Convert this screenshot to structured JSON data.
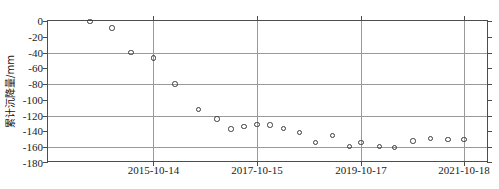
{
  "chart_data": {
    "type": "scatter",
    "title": "",
    "xlabel": "",
    "ylabel": "累计沉降量/mm",
    "x_tick_labels": [
      "2015-10-14",
      "2017-10-15",
      "2019-10-17",
      "2021-10-18"
    ],
    "x_tick_positions": [
      0.2392,
      0.4739,
      0.7098,
      0.9433
    ],
    "y_tick_labels": [
      "0",
      "-20",
      "-40",
      "-60",
      "-80",
      "-100",
      "-120",
      "-140",
      "-160",
      "-180"
    ],
    "y_tick_values": [
      0,
      -20,
      -40,
      -60,
      -80,
      -100,
      -120,
      -140,
      -160,
      -180
    ],
    "ylim": [
      -180,
      0
    ],
    "y_major_gridlines": [
      0,
      -40,
      -80,
      -120,
      -160
    ],
    "grid": true,
    "legend": "none",
    "marker": "open-circle",
    "marker_color": "#3a3a3a",
    "series": [
      {
        "name": "累计沉降量",
        "points": [
          {
            "xf": 0.0955,
            "y": -0.5
          },
          {
            "xf": 0.1451,
            "y": -9
          },
          {
            "xf": 0.188,
            "y": -40
          },
          {
            "xf": 0.2392,
            "y": -47
          },
          {
            "xf": 0.2878,
            "y": -80
          },
          {
            "xf": 0.3412,
            "y": -112
          },
          {
            "xf": 0.3832,
            "y": -124
          },
          {
            "xf": 0.415,
            "y": -137
          },
          {
            "xf": 0.4446,
            "y": -134
          },
          {
            "xf": 0.4739,
            "y": -131
          },
          {
            "xf": 0.503,
            "y": -132
          },
          {
            "xf": 0.5345,
            "y": -136
          },
          {
            "xf": 0.57,
            "y": -141
          },
          {
            "xf": 0.607,
            "y": -154
          },
          {
            "xf": 0.645,
            "y": -145
          },
          {
            "xf": 0.683,
            "y": -159
          },
          {
            "xf": 0.7098,
            "y": -154
          },
          {
            "xf": 0.751,
            "y": -159
          },
          {
            "xf": 0.786,
            "y": -160
          },
          {
            "xf": 0.828,
            "y": -152
          },
          {
            "xf": 0.868,
            "y": -149
          },
          {
            "xf": 0.907,
            "y": -150
          },
          {
            "xf": 0.9433,
            "y": -150
          }
        ]
      }
    ]
  }
}
